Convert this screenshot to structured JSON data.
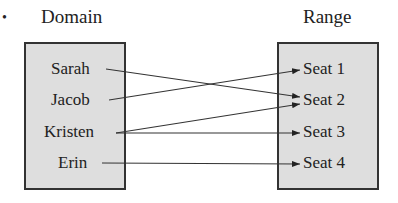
{
  "bullet": "•",
  "domain": {
    "title": "Domain",
    "items": [
      "Sarah",
      "Jacob",
      "Kristen",
      "Erin"
    ]
  },
  "range": {
    "title": "Range",
    "items": [
      "Seat 1",
      "Seat 2",
      "Seat 3",
      "Seat 4"
    ]
  },
  "mappings": [
    {
      "from": "Sarah",
      "to": "Seat 2"
    },
    {
      "from": "Jacob",
      "to": "Seat 1"
    },
    {
      "from": "Kristen",
      "to": "Seat 2"
    },
    {
      "from": "Kristen",
      "to": "Seat 3"
    },
    {
      "from": "Erin",
      "to": "Seat 4"
    }
  ]
}
